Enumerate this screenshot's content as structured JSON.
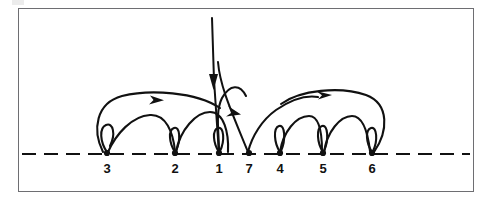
{
  "figure": {
    "title": "",
    "caption": "",
    "background_color": "#ffffff",
    "ink_color": "#111111",
    "frame_color": "#6e6e72",
    "axis": {
      "name": "baseline",
      "style": "dashed",
      "y": 154,
      "x_start": 22,
      "x_end": 470,
      "dash_length": 14,
      "dash_gap": 8
    },
    "nodes": [
      {
        "label": "3",
        "x": 107,
        "y": 154,
        "label_x": 107,
        "label_y": 172
      },
      {
        "label": "2",
        "x": 175,
        "y": 154,
        "label_x": 175,
        "label_y": 172
      },
      {
        "label": "1",
        "x": 219,
        "y": 154,
        "label_x": 219,
        "label_y": 172
      },
      {
        "label": "7",
        "x": 249,
        "y": 154,
        "label_x": 249,
        "label_y": 172
      },
      {
        "label": "4",
        "x": 280,
        "y": 154,
        "label_x": 280,
        "label_y": 172
      },
      {
        "label": "5",
        "x": 323,
        "y": 154,
        "label_x": 323,
        "label_y": 172
      },
      {
        "label": "6",
        "x": 372,
        "y": 154,
        "label_x": 372,
        "label_y": 172
      }
    ],
    "arcs": [
      {
        "name": "arc-3-to-1-large",
        "from": "3",
        "to": "1",
        "direction": "right",
        "apex_y": 97,
        "arrow_at_x": 155,
        "arrow_at_y": 100
      },
      {
        "name": "arc-3-to-2",
        "from": "3",
        "to": "2",
        "direction": "right",
        "apex_y": 116
      },
      {
        "name": "arc-2-to-1",
        "from": "2",
        "to": "1",
        "direction": "right",
        "apex_y": 113
      },
      {
        "name": "arc-1-to-7-cross",
        "from": "1",
        "to": "7",
        "direction": "right",
        "apex_y": 108
      },
      {
        "name": "arc-7-to-4-cross",
        "from": "7",
        "to": "4",
        "direction": "left",
        "apex_y": 103
      },
      {
        "name": "arc-4-to-5",
        "from": "4",
        "to": "5",
        "direction": "right",
        "apex_y": 116
      },
      {
        "name": "arc-5-to-6",
        "from": "5",
        "to": "6",
        "direction": "right",
        "apex_y": 116
      },
      {
        "name": "arc-6-to-4-large",
        "from": "6",
        "to": "4",
        "direction": "left",
        "apex_y": 93,
        "arrow_at_x": 327,
        "arrow_at_y": 95
      }
    ],
    "self_loops": [
      {
        "name": "loop-node-3",
        "node": "3"
      },
      {
        "name": "loop-node-2",
        "node": "2"
      },
      {
        "name": "loop-node-1",
        "node": "1"
      },
      {
        "name": "loop-node-4",
        "node": "4"
      },
      {
        "name": "loop-node-5",
        "node": "5"
      },
      {
        "name": "loop-node-6",
        "node": "6"
      }
    ],
    "vertical_lines": [
      {
        "name": "incoming-line-main",
        "x_top": 212,
        "y_top": 18,
        "x_bottom": 219,
        "y_bottom": 154,
        "arrow_y": 86,
        "arrow_direction": "down"
      },
      {
        "name": "incoming-line-secondary",
        "x_top": 218,
        "y_top": 62,
        "x_bottom": 249,
        "y_bottom": 154,
        "arrow_y": 112,
        "arrow_direction": "down"
      }
    ],
    "arrowheads": [
      {
        "name": "arrowhead-down-main",
        "x": 212,
        "y": 86,
        "direction": "down"
      },
      {
        "name": "arrowhead-right-on-3-1-arc",
        "x": 155,
        "y": 100,
        "direction": "right"
      },
      {
        "name": "arrowhead-up-left-on-7-4-arc",
        "x": 233,
        "y": 111,
        "direction": "up-left"
      },
      {
        "name": "arrowhead-left-on-6-4-arc",
        "x": 327,
        "y": 95,
        "direction": "left"
      }
    ]
  }
}
